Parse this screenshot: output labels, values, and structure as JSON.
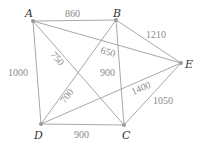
{
  "graph": {
    "nodes": [
      {
        "id": "A",
        "label": "A",
        "x": 33,
        "y": 21
      },
      {
        "id": "B",
        "label": "B",
        "x": 116,
        "y": 20
      },
      {
        "id": "E",
        "label": "E",
        "x": 181,
        "y": 63
      },
      {
        "id": "D",
        "label": "D",
        "x": 41,
        "y": 124
      },
      {
        "id": "C",
        "label": "C",
        "x": 124,
        "y": 125
      }
    ],
    "edges": [
      {
        "from": "A",
        "to": "B",
        "weight": "860"
      },
      {
        "from": "B",
        "to": "E",
        "weight": "1210"
      },
      {
        "from": "A",
        "to": "E",
        "weight": "650"
      },
      {
        "from": "A",
        "to": "D",
        "weight": "1000"
      },
      {
        "from": "A",
        "to": "C",
        "weight": "750"
      },
      {
        "from": "B",
        "to": "C",
        "weight": "900"
      },
      {
        "from": "B",
        "to": "D",
        "weight": "700"
      },
      {
        "from": "D",
        "to": "E",
        "weight": "1400"
      },
      {
        "from": "C",
        "to": "E",
        "weight": "1050"
      },
      {
        "from": "D",
        "to": "C",
        "weight": "900"
      }
    ]
  }
}
